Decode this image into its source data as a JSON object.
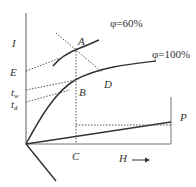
{
  "diagram": {
    "type": "psychrometric I-H diagram",
    "axes": {
      "vertical_label": "I",
      "horizontal_label": "H",
      "horizontal_arrow": "arrow-right"
    },
    "curves": [
      {
        "name": "relative-humidity-60",
        "label": "φ=60%"
      },
      {
        "name": "saturation-100",
        "label": "φ=100%"
      }
    ],
    "points": {
      "A": "A",
      "B": "B",
      "C": "C",
      "D": "D",
      "E": "E",
      "P": "P"
    },
    "axis_marks": {
      "E": "E",
      "tw_main": "t",
      "tw_sub": "w",
      "td_main": "t",
      "td_sub": "d"
    },
    "colors": {
      "line": "#333333",
      "dotted": "#555555",
      "background": "#ffffff"
    }
  }
}
